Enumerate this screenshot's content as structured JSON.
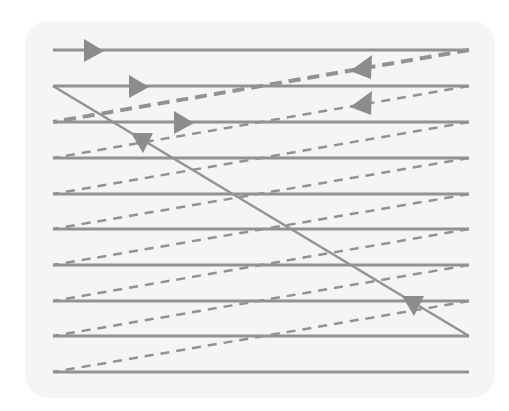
{
  "diagram": {
    "colors": {
      "background": "#ffffff",
      "panel": "#f5f5f5",
      "line": "#929292",
      "arrow": "#8c8c8c"
    },
    "scan_x_start": 53,
    "scan_x_end": 469,
    "scan_lines_y": [
      50,
      86,
      122,
      158,
      194,
      229,
      265,
      301,
      336,
      372
    ],
    "retrace_lines": [
      {
        "from": [
          469,
          50
        ],
        "to": [
          53,
          122
        ],
        "style": "dashed-thick"
      },
      {
        "from": [
          469,
          86
        ],
        "to": [
          53,
          158
        ],
        "style": "dashed"
      },
      {
        "from": [
          469,
          122
        ],
        "to": [
          53,
          194
        ],
        "style": "dashed"
      },
      {
        "from": [
          469,
          158
        ],
        "to": [
          53,
          229
        ],
        "style": "dashed"
      },
      {
        "from": [
          469,
          194
        ],
        "to": [
          53,
          265
        ],
        "style": "dashed"
      },
      {
        "from": [
          469,
          229
        ],
        "to": [
          53,
          301
        ],
        "style": "dashed"
      },
      {
        "from": [
          469,
          265
        ],
        "to": [
          53,
          336
        ],
        "style": "dashed"
      },
      {
        "from": [
          469,
          301
        ],
        "to": [
          53,
          372
        ],
        "style": "dashed"
      }
    ],
    "vertical_retrace": {
      "from": [
        53,
        86
      ],
      "to": [
        469,
        336
      ]
    },
    "arrows": [
      {
        "name": "scan-direction-arrow-1",
        "direction": "right",
        "x": 84,
        "y": 50
      },
      {
        "name": "scan-direction-arrow-2",
        "direction": "right",
        "x": 129,
        "y": 86
      },
      {
        "name": "scan-direction-arrow-3",
        "direction": "right",
        "x": 174,
        "y": 122
      },
      {
        "name": "retrace-arrow-1",
        "direction": "left",
        "x": 350,
        "y": 68
      },
      {
        "name": "retrace-arrow-2",
        "direction": "left",
        "x": 350,
        "y": 104
      },
      {
        "name": "vertical-retrace-arrow-1",
        "direction": "down",
        "x": 142,
        "y": 143
      },
      {
        "name": "vertical-retrace-arrow-2",
        "direction": "down",
        "x": 413,
        "y": 306
      }
    ]
  }
}
